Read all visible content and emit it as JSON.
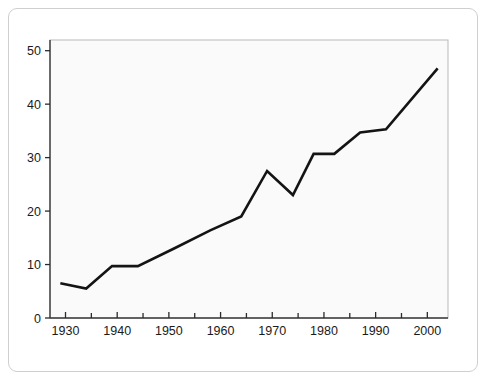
{
  "chart_data": {
    "type": "line",
    "title": "",
    "subtitle": "",
    "xlabel": "",
    "ylabel": "",
    "xlim": [
      1927,
      2004
    ],
    "ylim": [
      0,
      52
    ],
    "grid": false,
    "legend": null,
    "legend_position": "none",
    "line_color": "#141414",
    "plot_background": "#fafafa",
    "frame_color": "#cfcfcf",
    "x_tick_labels": [
      "1930",
      "1940",
      "1950",
      "1960",
      "1970",
      "1980",
      "1990",
      "2000"
    ],
    "x_major_ticks": [
      1930,
      1940,
      1950,
      1960,
      1970,
      1980,
      1990,
      2000
    ],
    "x_minor_ticks": [
      1935,
      1945,
      1955,
      1965,
      1975,
      1985,
      1995
    ],
    "y_tick_labels": [
      "0",
      "10",
      "20",
      "30",
      "40",
      "50"
    ],
    "y_ticks": [
      0,
      10,
      20,
      30,
      40,
      50
    ],
    "series": [
      {
        "name": "series-1",
        "x": [
          1929,
          1934,
          1939,
          1944,
          1951,
          1958,
          1964,
          1969,
          1974,
          1978,
          1982,
          1987,
          1992,
          2002
        ],
        "values": [
          6.5,
          5.5,
          9.7,
          9.7,
          13.0,
          16.4,
          19.0,
          27.5,
          23.0,
          30.7,
          30.7,
          34.7,
          35.3,
          46.7
        ]
      }
    ]
  }
}
